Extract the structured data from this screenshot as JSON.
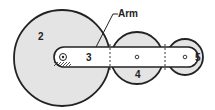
{
  "diagram": {
    "type": "epicyclic gear train",
    "labels": {
      "gear_sun": "2",
      "arm_number": "3",
      "gear_planet": "4",
      "gear_outer": "5",
      "arm_callout": "Arm"
    },
    "colors": {
      "gear_fill": "#e4e4e4",
      "arm_fill": "#ffffff",
      "stroke": "#222222"
    }
  }
}
